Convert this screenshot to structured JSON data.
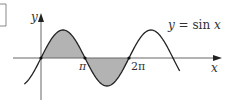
{
  "chart_data": {
    "type": "line",
    "title": "",
    "function_label": "y = sin x",
    "function_label_parts": {
      "lhs": "y",
      "eq": " = sin ",
      "var": "x"
    },
    "xlabel": "x",
    "ylabel": "y",
    "x_ticks": [
      {
        "value": 3.14159,
        "label": "π"
      },
      {
        "value": 6.28319,
        "label": "2π"
      }
    ],
    "x_range": [
      -1.2,
      9.9
    ],
    "y_range": [
      -1,
      1
    ],
    "series": [
      {
        "name": "y = sin x",
        "function": "sin(x)",
        "x_from": -1.2,
        "x_to": 9.9
      }
    ],
    "shaded_regions": [
      {
        "x_from": 0,
        "x_to": 3.14159,
        "description": "area above x-axis"
      },
      {
        "x_from": 3.14159,
        "x_to": 6.28319,
        "description": "area below x-axis"
      }
    ],
    "marked_points": [
      {
        "x": 0,
        "y": 0
      },
      {
        "x": 3.14159,
        "y": 0
      },
      {
        "x": 6.28319,
        "y": 0
      }
    ],
    "grid": false,
    "legend": "none",
    "colors": {
      "curve": "#222222",
      "fill": "#b3b3b3",
      "axis": "#555555"
    }
  }
}
